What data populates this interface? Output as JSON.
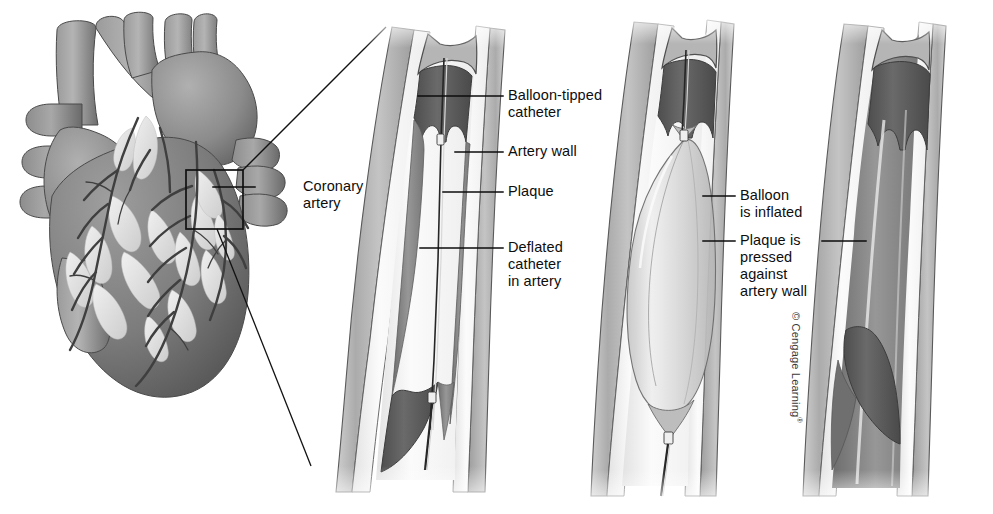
{
  "figure": {
    "background_color": "#ffffff"
  },
  "labels": [
    {
      "id": "coronary-artery",
      "text": "Coronary\nartery",
      "x": 303,
      "y": 178,
      "leader": {
        "x1": 255,
        "y1": 187,
        "x2": 213,
        "y2": 187
      }
    },
    {
      "id": "balloon-tipped-catheter",
      "text": "Balloon-tipped\ncatheter",
      "x": 508,
      "y": 87,
      "leader": {
        "x1": 503,
        "y1": 96,
        "x2": 418,
        "y2": 96
      }
    },
    {
      "id": "artery-wall",
      "text": "Artery wall",
      "x": 508,
      "y": 143,
      "leader": {
        "x1": 503,
        "y1": 152,
        "x2": 455,
        "y2": 152
      }
    },
    {
      "id": "plaque",
      "text": "Plaque",
      "x": 508,
      "y": 183,
      "leader": {
        "x1": 503,
        "y1": 192,
        "x2": 443,
        "y2": 192
      }
    },
    {
      "id": "deflated-catheter-in-artery",
      "text": "Deflated\ncatheter\nin artery",
      "x": 508,
      "y": 239,
      "leader": {
        "x1": 503,
        "y1": 248,
        "x2": 420,
        "y2": 248
      }
    },
    {
      "id": "balloon-is-inflated",
      "text": "Balloon\nis inflated",
      "x": 740,
      "y": 187,
      "leader": {
        "x1": 735,
        "y1": 196,
        "x2": 703,
        "y2": 196
      }
    },
    {
      "id": "plaque-is-pressed-against-artery-wall",
      "text": "Plaque is\npressed\nagainst\nartery wall",
      "x": 740,
      "y": 232,
      "leader": {
        "x1": 735,
        "y1": 241,
        "x2": 703,
        "y2": 241
      },
      "leader2": {
        "x1": 822,
        "y1": 241,
        "x2": 866,
        "y2": 241
      }
    }
  ],
  "panels": [
    {
      "id": "panel-1-deflated-catheter",
      "name": "Artery with plaque and deflated balloon catheter"
    },
    {
      "id": "panel-2-balloon-inflated",
      "name": "Balloon inflated inside artery"
    },
    {
      "id": "panel-3-plaque-pressed",
      "name": "Plaque pressed against artery wall, lumen open"
    }
  ],
  "heart": {
    "id": "heart-anatomy",
    "name": "Anterior view of the heart with coronary arteries",
    "magnifier_box": {
      "x": 186,
      "y": 170,
      "width": 57,
      "height": 59
    }
  },
  "magnification_lines": [
    {
      "id": "magnifier-line-top",
      "x1": 243,
      "y1": 170,
      "x2": 386,
      "y2": 27
    },
    {
      "id": "magnifier-line-bottom",
      "x1": 217,
      "y1": 229,
      "x2": 311,
      "y2": 466
    }
  ],
  "copyright": {
    "text": "© Cengage Learning",
    "registered_mark": "®"
  },
  "colors": {
    "ink": "#0d0d0d",
    "background": "#ffffff",
    "wall_outer": "#b9b9b9",
    "wall_mid": "#9a9a9a",
    "plaque_dark": "#5a5a5a",
    "plaque_mid": "#8a8a8a",
    "lumen_light": "#f2f2f2",
    "balloon": "#d6d6d6",
    "heart_muscle": "#8f8f8f",
    "heart_dark": "#5f5f5f",
    "vessel_light": "#e8e8e8"
  }
}
